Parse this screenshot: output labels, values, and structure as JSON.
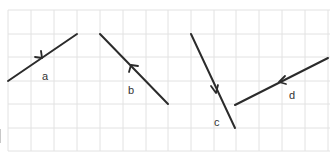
{
  "diagram": {
    "type": "vectors-on-grid",
    "grid": {
      "x0": 8,
      "cell_w": 23,
      "cols": 14,
      "y0": 10,
      "cell_h": 23.5,
      "rows": 6,
      "line_color": "#e2e2e2"
    },
    "vectors": [
      {
        "label": "a",
        "from": [
          8,
          81
        ],
        "to": [
          77,
          34
        ],
        "arrow_direction": "up-right"
      },
      {
        "label": "b",
        "from": [
          168,
          104
        ],
        "to": [
          100,
          34
        ],
        "arrow_direction": "up-left"
      },
      {
        "label": "c",
        "from": [
          191,
          34
        ],
        "to": [
          235,
          128
        ],
        "arrow_direction": "down-right"
      },
      {
        "label": "d",
        "from": [
          328,
          58
        ],
        "to": [
          235,
          104
        ],
        "arrow_direction": "down-left"
      }
    ],
    "stroke_color": "#2b2b2b"
  }
}
